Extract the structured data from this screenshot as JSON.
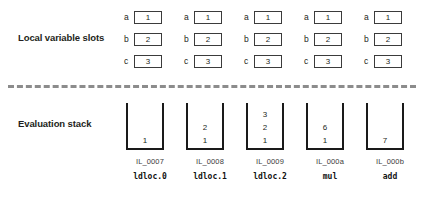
{
  "sections": {
    "locals_label": "Local variable slots",
    "stack_label": "Evaluation stack"
  },
  "columns": [
    {
      "left": 120,
      "slots": [
        {
          "name": "a",
          "value": "1"
        },
        {
          "name": "b",
          "value": "2"
        },
        {
          "name": "c",
          "value": "3"
        }
      ],
      "stack": [
        "1"
      ],
      "offset": "IL_0007",
      "opcode": "ldloc.0"
    },
    {
      "left": 180,
      "slots": [
        {
          "name": "a",
          "value": "1"
        },
        {
          "name": "b",
          "value": "2"
        },
        {
          "name": "c",
          "value": "3"
        }
      ],
      "stack": [
        "2",
        "1"
      ],
      "offset": "IL_0008",
      "opcode": "ldloc.1"
    },
    {
      "left": 240,
      "slots": [
        {
          "name": "a",
          "value": "1"
        },
        {
          "name": "b",
          "value": "2"
        },
        {
          "name": "c",
          "value": "3"
        }
      ],
      "stack": [
        "3",
        "2",
        "1"
      ],
      "offset": "IL_0009",
      "opcode": "ldloc.2"
    },
    {
      "left": 300,
      "slots": [
        {
          "name": "a",
          "value": "1"
        },
        {
          "name": "b",
          "value": "2"
        },
        {
          "name": "c",
          "value": "3"
        }
      ],
      "stack": [
        "6",
        "1"
      ],
      "offset": "IL_000a",
      "opcode": "mul"
    },
    {
      "left": 360,
      "slots": [
        {
          "name": "a",
          "value": "1"
        },
        {
          "name": "b",
          "value": "2"
        },
        {
          "name": "c",
          "value": "3"
        }
      ],
      "stack": [
        "7"
      ],
      "offset": "IL_000b",
      "opcode": "add"
    }
  ],
  "colors": {
    "divider": "#8c8c8c",
    "slot_border": "#3b3b3b",
    "stack_border": "#1a1a1a",
    "text": "#231f20",
    "background": "#ffffff"
  }
}
